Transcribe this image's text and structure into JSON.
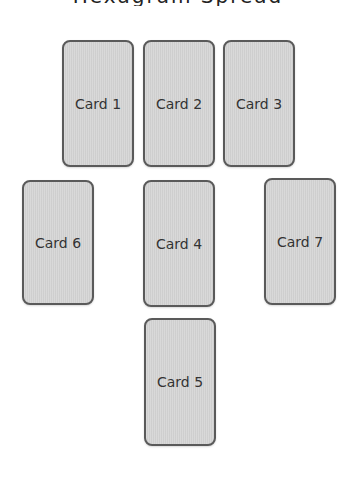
{
  "title": "Hexagram Spread",
  "cards": [
    {
      "label": "Card 1",
      "x": 62,
      "y": 40,
      "w": 72,
      "h": 127
    },
    {
      "label": "Card 2",
      "x": 143,
      "y": 40,
      "w": 72,
      "h": 127
    },
    {
      "label": "Card 3",
      "x": 223,
      "y": 40,
      "w": 72,
      "h": 127
    },
    {
      "label": "Card 4",
      "x": 143,
      "y": 180,
      "w": 72,
      "h": 127
    },
    {
      "label": "Card 5",
      "x": 144,
      "y": 318,
      "w": 72,
      "h": 128
    },
    {
      "label": "Card 6",
      "x": 22,
      "y": 180,
      "w": 72,
      "h": 125
    },
    {
      "label": "Card 7",
      "x": 264,
      "y": 178,
      "w": 72,
      "h": 127
    }
  ],
  "colors": {
    "card_fill": "#d5d5d5",
    "card_border": "#5a5a5a",
    "label": "#333333",
    "background": "#ffffff"
  }
}
